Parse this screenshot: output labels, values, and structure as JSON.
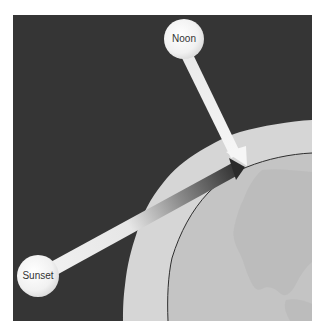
{
  "diagram": {
    "type": "illustration",
    "labels": {
      "noon": "Noon",
      "sunset": "Sunset"
    },
    "elements": [
      {
        "id": "space-background",
        "description": "dark square background representing space"
      },
      {
        "id": "atmosphere",
        "description": "light gray band surrounding Earth"
      },
      {
        "id": "earth",
        "description": "globe showing North America"
      },
      {
        "id": "noon-sun",
        "label": "Noon",
        "description": "sun high overhead with short straight white ray to observer"
      },
      {
        "id": "sunset-sun",
        "label": "Sunset",
        "description": "sun near horizon with long ray through atmosphere, fading white to dark"
      }
    ],
    "colors": {
      "space": "#353535",
      "atmosphere": "#d6d6d6",
      "earth": "#c4c4c4",
      "land": "#b9b9b9",
      "earth_outline": "#2e2e2e",
      "sun": "#f4f4f4",
      "ray_light": "#f2f2f2",
      "ray_dark": "#2a2a2a"
    }
  }
}
